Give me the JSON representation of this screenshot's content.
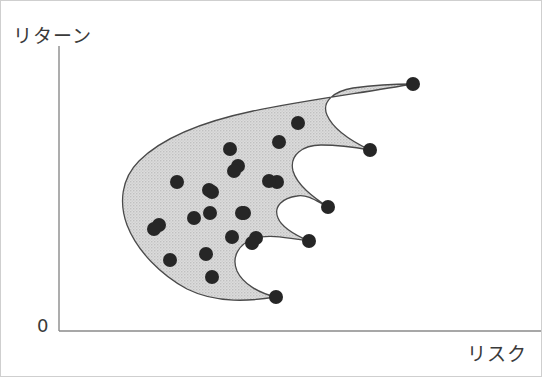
{
  "figure": {
    "width": 542,
    "height": 377,
    "background_color": "#ffffff",
    "frame_color": "#cfcfcf"
  },
  "axes": {
    "y_label": "リターン",
    "x_label": "リスク",
    "origin_label": "0",
    "axis_color": "#8a8a8a",
    "y_axis": {
      "x": 58,
      "y_top": 45,
      "y_bottom": 330
    },
    "x_axis": {
      "y": 330,
      "x_left": 58,
      "x_right": 541
    }
  },
  "chart_data": {
    "type": "scatter",
    "title": "",
    "xlabel": "リスク",
    "ylabel": "リターン",
    "grid": false,
    "legend": null,
    "region": {
      "name": "feasible-set",
      "fill_color": "#d4d4d4",
      "stroke_color": "#4a4a4a",
      "description": "Shaded feasible investment opportunity set with scalloped efficient right boundary"
    },
    "marker": {
      "shape": "circle",
      "radius": 7,
      "color": "#262626"
    },
    "series": [
      {
        "name": "efficient-points",
        "description": "Outer points on spikes along the efficient frontier",
        "points": [
          {
            "x": 412,
            "y": 83
          },
          {
            "x": 369,
            "y": 149
          },
          {
            "x": 327,
            "y": 206
          },
          {
            "x": 308,
            "y": 240
          },
          {
            "x": 275,
            "y": 296
          }
        ]
      },
      {
        "name": "interior-points",
        "description": "Dots scattered inside the shaded feasible region",
        "points": [
          {
            "x": 297,
            "y": 122
          },
          {
            "x": 278,
            "y": 141
          },
          {
            "x": 276,
            "y": 181
          },
          {
            "x": 268,
            "y": 180
          },
          {
            "x": 237,
            "y": 165
          },
          {
            "x": 233,
            "y": 170
          },
          {
            "x": 229,
            "y": 148
          },
          {
            "x": 211,
            "y": 191
          },
          {
            "x": 208,
            "y": 189
          },
          {
            "x": 176,
            "y": 181
          },
          {
            "x": 209,
            "y": 212
          },
          {
            "x": 243,
            "y": 212
          },
          {
            "x": 241,
            "y": 212
          },
          {
            "x": 193,
            "y": 217
          },
          {
            "x": 158,
            "y": 224
          },
          {
            "x": 153,
            "y": 228
          },
          {
            "x": 205,
            "y": 253
          },
          {
            "x": 255,
            "y": 237
          },
          {
            "x": 231,
            "y": 236
          },
          {
            "x": 169,
            "y": 259
          },
          {
            "x": 211,
            "y": 276
          },
          {
            "x": 251,
            "y": 242
          }
        ]
      }
    ]
  }
}
